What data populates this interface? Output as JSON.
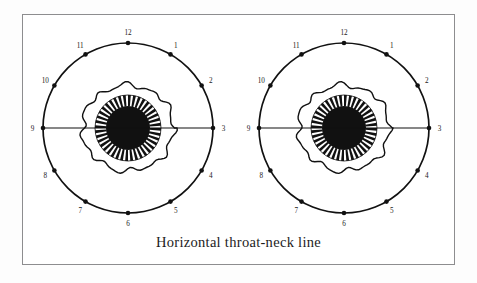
{
  "figure": {
    "caption": "Horizontal throat-neck line",
    "frame": {
      "border_color": "#8d8d8f",
      "background_color": "#ffffff"
    },
    "ink_color": "#111111",
    "paper_color": "#fdfdfd"
  },
  "diagrams": [
    {
      "name": "left-eye-clock-diagram",
      "center_x": 128,
      "center_y": 128,
      "outer_radius": 85,
      "limbus_radius": 46,
      "iris_outer_radius": 33,
      "pupil_radius": 22,
      "spoke_count": 40,
      "clock_markers": [
        {
          "label": "12",
          "hour": 12
        },
        {
          "label": "1",
          "hour": 1
        },
        {
          "label": "2",
          "hour": 2
        },
        {
          "label": "3",
          "hour": 3
        },
        {
          "label": "4",
          "hour": 4
        },
        {
          "label": "5",
          "hour": 5
        },
        {
          "label": "6",
          "hour": 6
        },
        {
          "label": "7",
          "hour": 7
        },
        {
          "label": "8",
          "hour": 8
        },
        {
          "label": "9",
          "hour": 9
        },
        {
          "label": "10",
          "hour": 10
        },
        {
          "label": "11",
          "hour": 11
        }
      ]
    },
    {
      "name": "right-eye-clock-diagram",
      "center_x": 344,
      "center_y": 128,
      "outer_radius": 85,
      "limbus_radius": 46,
      "iris_outer_radius": 33,
      "pupil_radius": 22,
      "spoke_count": 40,
      "clock_markers": [
        {
          "label": "12",
          "hour": 12
        },
        {
          "label": "1",
          "hour": 1
        },
        {
          "label": "2",
          "hour": 2
        },
        {
          "label": "3",
          "hour": 3
        },
        {
          "label": "4",
          "hour": 4
        },
        {
          "label": "5",
          "hour": 5
        },
        {
          "label": "6",
          "hour": 6
        },
        {
          "label": "7",
          "hour": 7
        },
        {
          "label": "8",
          "hour": 8
        },
        {
          "label": "9",
          "hour": 9
        },
        {
          "label": "10",
          "hour": 10
        },
        {
          "label": "11",
          "hour": 11
        }
      ]
    }
  ],
  "horizontal_line": {
    "name": "horizontal-throat-neck-line",
    "from_hour": 9,
    "to_hour": 3,
    "y": 128
  }
}
